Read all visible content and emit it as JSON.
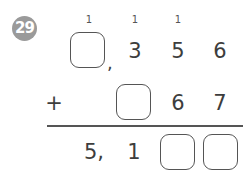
{
  "problem": {
    "number": "29",
    "badge_color": "#9a9a9a",
    "carries": [
      "1",
      "1",
      "1"
    ],
    "row1": {
      "blank_thousands": "",
      "separator": ",",
      "digits": [
        "3",
        "5",
        "6"
      ]
    },
    "row2": {
      "operator": "+",
      "blank_hundreds": "",
      "digits": [
        "6",
        "7"
      ]
    },
    "result": {
      "thousands": "5,",
      "hundreds": "1",
      "blank_tens": "",
      "blank_ones": ""
    }
  }
}
